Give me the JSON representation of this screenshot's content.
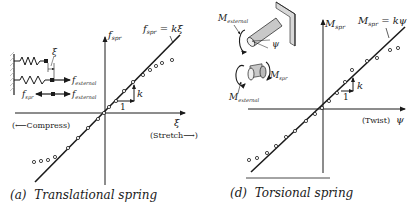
{
  "panels": [
    {
      "id": "a",
      "caption_letter": "(a)",
      "caption_title": "Translational spring",
      "y_axis_label": "f",
      "y_axis_sub": "spr",
      "x_axis_label": "ξ",
      "x_pos_note": "(Stretch⟶)",
      "x_neg_note": "(⟵Compress)",
      "line_eq_lhs": "f",
      "line_eq_sub": "spr",
      "line_eq_rhs": " = kξ",
      "slope_run_label": "1",
      "slope_rise_label": "k",
      "inset": {
        "disp_label": "ξ",
        "force_ext_label": "f",
        "force_ext_sub": "external",
        "force_spr_label": "f",
        "force_spr_sub": "spr",
        "force_ext2_label": "f",
        "force_ext2_sub": "external"
      }
    },
    {
      "id": "d",
      "caption_letter": "(d)",
      "caption_title": "Torsional spring",
      "y_axis_label": "M",
      "y_axis_sub": "spr",
      "x_axis_label": "ψ",
      "x_pos_note": "(Twist)",
      "line_eq_lhs": "M",
      "line_eq_sub": "spr",
      "line_eq_rhs": " = kψ",
      "slope_run_label": "1",
      "slope_rise_label": "k",
      "inset": {
        "moment_ext_label": "M",
        "moment_ext_sub": "external",
        "angle_label": "ψ",
        "moment_spr_label": "M",
        "moment_spr_sub": "spr",
        "moment_ext2_label": "M",
        "moment_ext2_sub": "external"
      }
    }
  ],
  "colors": {
    "ink": "#1a1a1a",
    "background": "#ffffff",
    "shade": "#8a8a8a"
  }
}
